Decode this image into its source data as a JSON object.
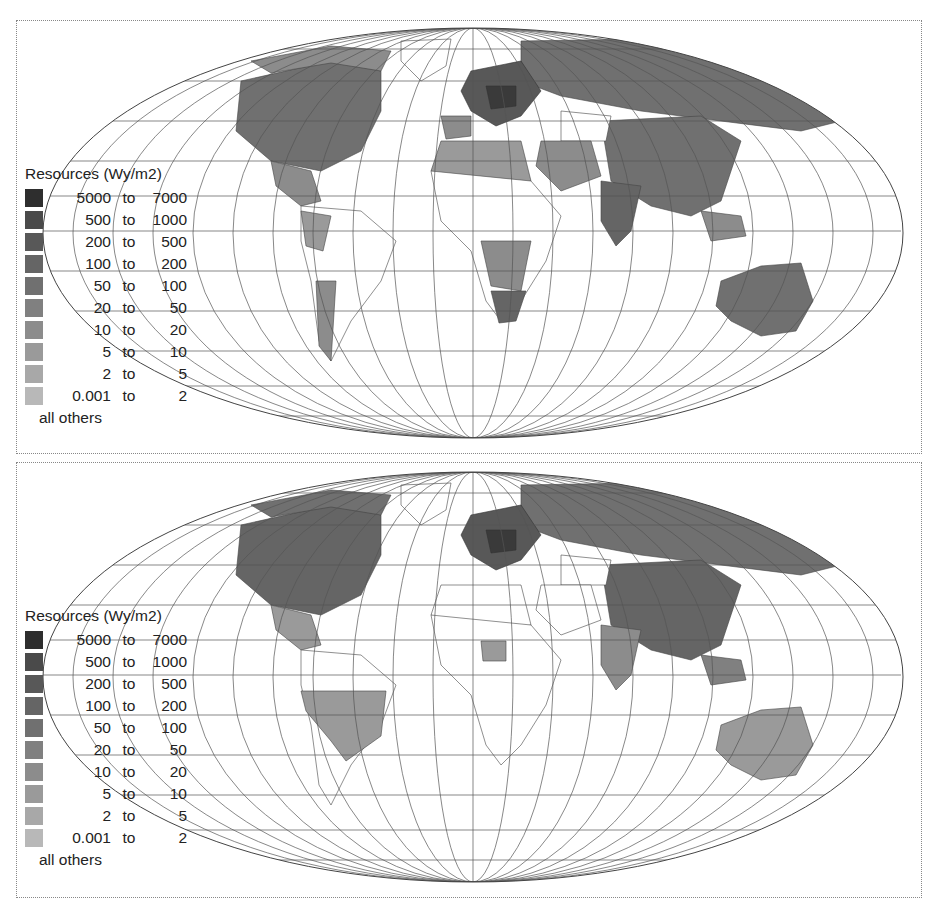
{
  "maps": [
    {
      "id": "top",
      "legend": {
        "title": "Resources (Wy/m2)",
        "classes": [
          {
            "from": "5000",
            "to_word": "to",
            "upto": "7000",
            "color": "#2e2e2e"
          },
          {
            "from": "500",
            "to_word": "to",
            "upto": "1000",
            "color": "#4a4a4a"
          },
          {
            "from": "200",
            "to_word": "to",
            "upto": "500",
            "color": "#585858"
          },
          {
            "from": "100",
            "to_word": "to",
            "upto": "200",
            "color": "#656565"
          },
          {
            "from": "50",
            "to_word": "to",
            "upto": "100",
            "color": "#707070"
          },
          {
            "from": "20",
            "to_word": "to",
            "upto": "50",
            "color": "#808080"
          },
          {
            "from": "10",
            "to_word": "to",
            "upto": "20",
            "color": "#8c8c8c"
          },
          {
            "from": "5",
            "to_word": "to",
            "upto": "10",
            "color": "#9a9a9a"
          },
          {
            "from": "2",
            "to_word": "to",
            "upto": "5",
            "color": "#a8a8a8"
          },
          {
            "from": "0.001",
            "to_word": "to",
            "upto": "2",
            "color": "#b8b8b8"
          }
        ],
        "others_label": "all others"
      }
    },
    {
      "id": "bottom",
      "legend": {
        "title": "Resources (Wy/m2)",
        "classes": [
          {
            "from": "5000",
            "to_word": "to",
            "upto": "7000",
            "color": "#2e2e2e"
          },
          {
            "from": "500",
            "to_word": "to",
            "upto": "1000",
            "color": "#4a4a4a"
          },
          {
            "from": "200",
            "to_word": "to",
            "upto": "500",
            "color": "#585858"
          },
          {
            "from": "100",
            "to_word": "to",
            "upto": "200",
            "color": "#656565"
          },
          {
            "from": "50",
            "to_word": "to",
            "upto": "100",
            "color": "#707070"
          },
          {
            "from": "20",
            "to_word": "to",
            "upto": "50",
            "color": "#808080"
          },
          {
            "from": "10",
            "to_word": "to",
            "upto": "20",
            "color": "#8c8c8c"
          },
          {
            "from": "5",
            "to_word": "to",
            "upto": "10",
            "color": "#9a9a9a"
          },
          {
            "from": "2",
            "to_word": "to",
            "upto": "5",
            "color": "#a8a8a8"
          },
          {
            "from": "0.001",
            "to_word": "to",
            "upto": "2",
            "color": "#b8b8b8"
          }
        ],
        "others_label": "all others"
      }
    }
  ],
  "colors": {
    "graticule": "#555555",
    "border": "#444444",
    "background": "#ffffff",
    "others": "#ffffff"
  }
}
